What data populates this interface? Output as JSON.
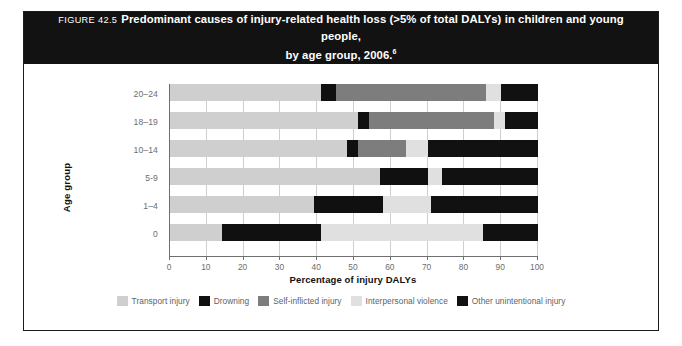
{
  "figure": {
    "label": "FIGURE 42.5",
    "title_line1": "Predominant causes of injury-related health loss (>5% of total DALYs) in children and young people,",
    "title_line2": "by age group, 2006.",
    "title_superscript": "6"
  },
  "chart_data": {
    "type": "bar",
    "orientation": "horizontal",
    "stacked": true,
    "normalized": true,
    "title": "Predominant causes of injury-related health loss (>5% of total DALYs) in children and young people, by age group, 2006.",
    "xlabel": "Percentage of injury DALYs",
    "ylabel": "Age group",
    "xlim": [
      0,
      100
    ],
    "xticks": [
      0,
      10,
      20,
      30,
      40,
      50,
      60,
      70,
      80,
      90,
      100
    ],
    "xtick_labels": [
      "0",
      "10",
      "20",
      "30",
      "40",
      "50",
      "60",
      "70",
      "80",
      "90",
      "100"
    ],
    "grid": true,
    "legend_position": "bottom",
    "categories": [
      "20–24",
      "18–19",
      "10–14",
      "5-9",
      "1–4",
      "0"
    ],
    "series": [
      {
        "name": "Transport injury",
        "color": "#cfcfcf",
        "values": [
          41,
          51,
          48,
          57,
          39,
          14
        ]
      },
      {
        "name": "Drowning",
        "color": "#101010",
        "values": [
          4,
          3,
          3,
          13,
          19,
          27
        ]
      },
      {
        "name": "Self-inflicted injury",
        "color": "#7d7d7d",
        "values": [
          41,
          34,
          13,
          0,
          0,
          0
        ]
      },
      {
        "name": "Interpersonal violence",
        "color": "#e0e0e0",
        "values": [
          4,
          3,
          6,
          4,
          13,
          44
        ]
      },
      {
        "name": "Other unintentional injury",
        "color": "#111111",
        "values": [
          10,
          9,
          30,
          26,
          29,
          15
        ]
      }
    ]
  },
  "legend": {
    "items": [
      {
        "label": "Transport injury",
        "color": "#cfcfcf"
      },
      {
        "label": "Drowning",
        "color": "#101010"
      },
      {
        "label": "Self-inflicted injury",
        "color": "#7d7d7d"
      },
      {
        "label": "Interpersonal violence",
        "color": "#e0e0e0"
      },
      {
        "label": "Other unintentional injury",
        "color": "#111111"
      }
    ]
  }
}
